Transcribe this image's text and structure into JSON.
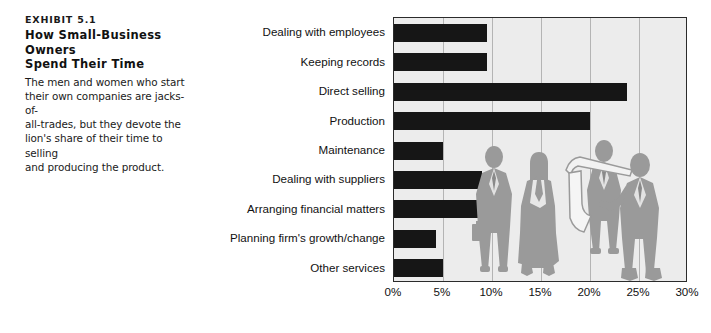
{
  "exhibit": {
    "number": "EXHIBIT 5.1",
    "title_line1": "How Small-Business Owners",
    "title_line2": "Spend Their Time",
    "desc_line1": "The men and women who start",
    "desc_line2": "their own companies are jacks-of-",
    "desc_line3": "all-trades, but they devote the",
    "desc_line4": "lion's share of their time to selling",
    "desc_line5": "and producing the product."
  },
  "colors": {
    "bar": "#161616",
    "plot_background": "#ececec",
    "gridline": "#b4b4b4",
    "axis_border": "#2b2b2b",
    "figure_fill": "#9a9a9a",
    "text": "#111111"
  },
  "chart_data": {
    "type": "bar",
    "orientation": "horizontal",
    "title": "How Small-Business Owners Spend Their Time",
    "xlabel": "",
    "ylabel": "",
    "xlim": [
      0,
      30
    ],
    "grid": true,
    "legend": "none",
    "tick_labels": [
      "0%",
      "5%",
      "10%",
      "15%",
      "20%",
      "25%",
      "30%"
    ],
    "ticks": [
      0,
      5,
      10,
      15,
      20,
      25,
      30
    ],
    "categories": [
      "Dealing with employees",
      "Keeping records",
      "Direct selling",
      "Production",
      "Maintenance",
      "Dealing with suppliers",
      "Arranging financial matters",
      "Planning firm's growth/change",
      "Other services"
    ],
    "values": [
      9.5,
      9.5,
      23.8,
      20.0,
      5.0,
      9.0,
      9.0,
      4.3,
      5.0
    ]
  },
  "figures": {
    "count": 4,
    "description": "silhouettes of four business people"
  }
}
